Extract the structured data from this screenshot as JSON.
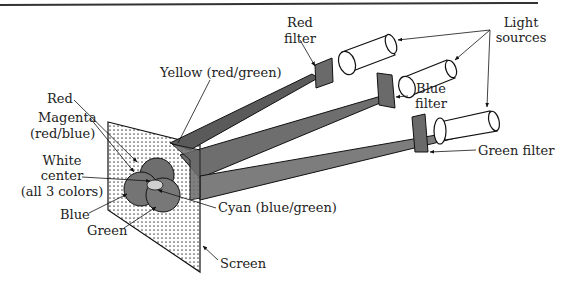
{
  "diagram": {
    "colors": {
      "border_line": "#333333",
      "beam_dark": "#5a5a5a",
      "beam_mid": "#6e6e6e",
      "beam_light": "#7d7d7d",
      "filter": "#6a6a6a",
      "screen_bg": "#ffffff",
      "screen_dots": "#555555",
      "circle_fill": "#6e6e6e",
      "white_center": "#d0d0d0",
      "outline": "#111111"
    },
    "labels": {
      "red_filter_line1": "Red",
      "red_filter_line2": "filter",
      "light_sources_line1": "Light",
      "light_sources_line2": "sources",
      "blue_filter_line1": "Blue",
      "blue_filter_line2": "filter",
      "green_filter": "Green filter",
      "yellow": "Yellow (red/green)",
      "red": "Red",
      "magenta_line1": "Magenta",
      "magenta_line2": "(red/blue)",
      "white_line1": "White",
      "white_line2": "center",
      "white_line3": "(all 3 colors)",
      "blue": "Blue",
      "green": "Green",
      "cyan": "Cyan (blue/green)",
      "screen": "Screen"
    },
    "components": [
      {
        "name": "light-source",
        "filter": "Red filter"
      },
      {
        "name": "light-source",
        "filter": "Blue filter"
      },
      {
        "name": "light-source",
        "filter": "Green filter"
      },
      {
        "name": "screen",
        "overlaps": [
          "Red",
          "Blue",
          "Green",
          "Yellow (red/green)",
          "Magenta (red/blue)",
          "Cyan (blue/green)",
          "White center (all 3 colors)"
        ]
      }
    ]
  }
}
